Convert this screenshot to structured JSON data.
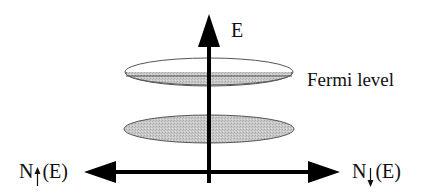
{
  "diagram": {
    "axes": {
      "vertical_label": "E",
      "left_label_prefix": "N",
      "left_label_suffix": "(E)",
      "left_spin": "up",
      "right_label_prefix": "N",
      "right_label_suffix": "(E)",
      "right_spin": "down"
    },
    "annotations": {
      "fermi_level": "Fermi level"
    },
    "bands": [
      {
        "name": "upper-band",
        "fill": "partial",
        "description": "top half empty, bottom half filled"
      },
      {
        "name": "lower-band",
        "fill": "full"
      }
    ],
    "colors": {
      "axis": "#000000",
      "band_fill": "#c8c8c8",
      "band_outline": "#555555"
    }
  }
}
